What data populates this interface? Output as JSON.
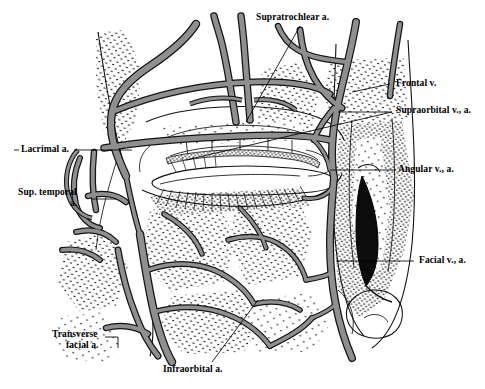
{
  "figure": {
    "type": "anatomical-illustration",
    "background_color": "#ffffff",
    "vessel_fill_color": "#8a8a8a",
    "vessel_outline_color": "#141414",
    "stipple_color": "#1a1a1a",
    "dark_vessel_color": "#111111",
    "leader_line_color": "#000000"
  },
  "labels": [
    {
      "id": "supratrochlear",
      "text": "Supratrochlear a.",
      "x": 256,
      "y": 12,
      "align": "left"
    },
    {
      "id": "frontal-v",
      "text": "Frontal v.",
      "x": 396,
      "y": 80,
      "align": "left"
    },
    {
      "id": "supraorbital",
      "text": "Supraorbital v., a.",
      "x": 396,
      "y": 107,
      "align": "left"
    },
    {
      "id": "angular",
      "text": "Angular v., a.",
      "x": 398,
      "y": 166,
      "align": "left"
    },
    {
      "id": "facial",
      "text": "Facial v., a.",
      "x": 419,
      "y": 257,
      "align": "left"
    },
    {
      "id": "lacrimal",
      "text": "Lacrimal a.",
      "x": 18,
      "y": 146,
      "align": "left"
    },
    {
      "id": "sup-temporal-1",
      "text": "Sup. temporal",
      "x": 18,
      "y": 189,
      "align": "left"
    },
    {
      "id": "sup-temporal-2",
      "text": "a.",
      "x": 70,
      "y": 200,
      "align": "left"
    },
    {
      "id": "transverse-1",
      "text": "Transverse",
      "x": 52,
      "y": 331,
      "align": "left"
    },
    {
      "id": "transverse-2",
      "text": "facial a.",
      "x": 66,
      "y": 342,
      "align": "left"
    },
    {
      "id": "infraorbital",
      "text": "Infraorbital a.",
      "x": 163,
      "y": 366,
      "align": "left"
    }
  ],
  "structures": [
    {
      "name": "supratrochlear-artery",
      "region": "medial-forehead"
    },
    {
      "name": "frontal-vein",
      "region": "forehead"
    },
    {
      "name": "supraorbital-vessels",
      "region": "superior-orbital-margin"
    },
    {
      "name": "angular-vessels",
      "region": "medial-canthus-nose"
    },
    {
      "name": "facial-vessels",
      "region": "lateral-nose-cheek"
    },
    {
      "name": "lacrimal-artery",
      "region": "lateral-orbit"
    },
    {
      "name": "superficial-temporal-artery",
      "region": "temple"
    },
    {
      "name": "transverse-facial-artery",
      "region": "preauricular-cheek"
    },
    {
      "name": "infraorbital-artery",
      "region": "infraorbital-cheek"
    },
    {
      "name": "palpebral-arcades",
      "region": "eyelids"
    },
    {
      "name": "eyelashes",
      "region": "lid-margin"
    },
    {
      "name": "nasal-ala",
      "region": "nose-tip"
    }
  ]
}
